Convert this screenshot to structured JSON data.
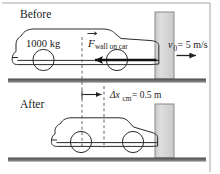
{
  "figure": {
    "title_semantic": "car-wall-collision-diagram",
    "background_color": "#ffffff",
    "ink_color": "#2b2b2b",
    "wall_fill": "#d6d6d6",
    "wall_stroke": "#8a8a8a",
    "ground_color": "#6e6e6e",
    "dashed_color": "#555555"
  },
  "panels": {
    "before": {
      "phase_label": "Before",
      "mass_label": "1000 kg",
      "force": {
        "symbol": "F",
        "vector_accent": "→",
        "subscript": "wall on car",
        "direction": "left"
      },
      "velocity": {
        "symbol": "v",
        "subscript": "0",
        "equals": "= 5 m/s",
        "full_text": "v0 = 5 m/s",
        "direction": "right"
      }
    },
    "after": {
      "phase_label": "After",
      "displacement": {
        "symbol": "Δx",
        "subscript": "cm",
        "equals": "= 0.5 m",
        "full_text": "Δxcm = 0.5 m",
        "direction": "right"
      }
    }
  }
}
